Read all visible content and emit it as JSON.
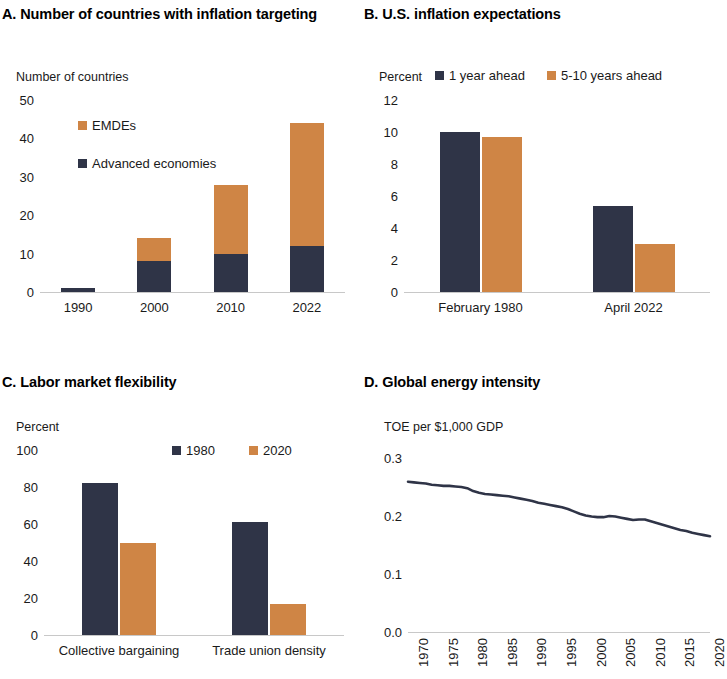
{
  "figure": {
    "panels": [
      "A",
      "B",
      "C",
      "D"
    ]
  },
  "colors": {
    "advanced": "#2f3447",
    "emdes": "#cf8545",
    "line": "#2f3447",
    "axis": "#c8c8c8",
    "text": "#1a1a1a"
  },
  "panel_a": {
    "title": "A. Number of countries with inflation targeting",
    "axis_unit": "Number of countries",
    "legend": [
      {
        "label": "EMDEs",
        "color": "#cf8545"
      },
      {
        "label": "Advanced economies",
        "color": "#2f3447"
      }
    ],
    "yticks": [
      "0",
      "10",
      "20",
      "30",
      "40",
      "50"
    ],
    "xticks": [
      "1990",
      "2000",
      "2010",
      "2022"
    ]
  },
  "panel_b": {
    "title": "B. U.S. inflation expectations",
    "axis_unit": "Percent",
    "legend": [
      {
        "label": "1 year ahead",
        "color": "#2f3447"
      },
      {
        "label": "5-10 years ahead",
        "color": "#cf8545"
      }
    ],
    "yticks": [
      "0",
      "2",
      "4",
      "6",
      "8",
      "10",
      "12"
    ],
    "xticks": [
      "February  1980",
      "April  2022"
    ]
  },
  "panel_c": {
    "title": "C. Labor market flexibility",
    "axis_unit": "Percent",
    "legend": [
      {
        "label": "1980",
        "color": "#2f3447"
      },
      {
        "label": "2020",
        "color": "#cf8545"
      }
    ],
    "yticks": [
      "0",
      "20",
      "40",
      "60",
      "80",
      "100"
    ],
    "xticks": [
      "Collective bargaining",
      "Trade union density"
    ]
  },
  "panel_d": {
    "title": "D. Global energy intensity",
    "axis_unit": "TOE per $1,000 GDP",
    "yticks": [
      "0.0",
      "0.1",
      "0.2",
      "0.3"
    ],
    "xticks": [
      "1970",
      "1975",
      "1980",
      "1985",
      "1990",
      "1995",
      "2000",
      "2005",
      "2010",
      "2015",
      "2020"
    ]
  },
  "chart_data": [
    {
      "panel": "A",
      "type": "bar",
      "stacked": true,
      "title": "A. Number of countries with inflation targeting",
      "xlabel": "",
      "ylabel": "Number of countries",
      "ylim": [
        0,
        50
      ],
      "yticks": [
        0,
        10,
        20,
        30,
        40,
        50
      ],
      "grid": false,
      "legend_position": "upper-left",
      "categories": [
        "1990",
        "2000",
        "2010",
        "2022"
      ],
      "series": [
        {
          "name": "Advanced economies",
          "color": "#2f3447",
          "values": [
            1,
            8,
            10,
            12
          ]
        },
        {
          "name": "EMDEs",
          "color": "#cf8545",
          "values": [
            0,
            6,
            18,
            32
          ]
        }
      ],
      "totals": [
        1,
        14,
        28,
        44
      ]
    },
    {
      "panel": "B",
      "type": "bar",
      "stacked": false,
      "title": "B. U.S. inflation expectations",
      "xlabel": "",
      "ylabel": "Percent",
      "ylim": [
        0,
        12
      ],
      "yticks": [
        0,
        2,
        4,
        6,
        8,
        10,
        12
      ],
      "grid": false,
      "legend_position": "upper-right",
      "categories": [
        "February  1980",
        "April  2022"
      ],
      "series": [
        {
          "name": "1 year ahead",
          "color": "#2f3447",
          "values": [
            10.0,
            5.4
          ]
        },
        {
          "name": "5-10 years ahead",
          "color": "#cf8545",
          "values": [
            9.7,
            3.0
          ]
        }
      ]
    },
    {
      "panel": "C",
      "type": "bar",
      "stacked": false,
      "title": "C. Labor market flexibility",
      "xlabel": "",
      "ylabel": "Percent",
      "ylim": [
        0,
        100
      ],
      "yticks": [
        0,
        20,
        40,
        60,
        80,
        100
      ],
      "grid": false,
      "legend_position": "upper-right",
      "categories": [
        "Collective bargaining",
        "Trade union density"
      ],
      "series": [
        {
          "name": "1980",
          "color": "#2f3447",
          "values": [
            82,
            61
          ]
        },
        {
          "name": "2020",
          "color": "#cf8545",
          "values": [
            50,
            17
          ]
        }
      ]
    },
    {
      "panel": "D",
      "type": "line",
      "title": "D. Global energy intensity",
      "xlabel": "",
      "ylabel": "TOE per $1,000 GDP",
      "ylim": [
        0.0,
        0.3
      ],
      "yticks": [
        0.0,
        0.1,
        0.2,
        0.3
      ],
      "xlim": [
        1970,
        2021
      ],
      "xticks": [
        1970,
        1975,
        1980,
        1985,
        1990,
        1995,
        2000,
        2005,
        2010,
        2015,
        2020
      ],
      "grid": false,
      "legend_position": "none",
      "series": [
        {
          "name": "Global energy intensity",
          "color": "#2f3447",
          "x": [
            1970,
            1971,
            1972,
            1973,
            1974,
            1975,
            1976,
            1977,
            1978,
            1979,
            1980,
            1981,
            1982,
            1983,
            1984,
            1985,
            1986,
            1987,
            1988,
            1989,
            1990,
            1991,
            1992,
            1993,
            1994,
            1995,
            1996,
            1997,
            1998,
            1999,
            2000,
            2001,
            2002,
            2003,
            2004,
            2005,
            2006,
            2007,
            2008,
            2009,
            2010,
            2011,
            2012,
            2013,
            2014,
            2015,
            2016,
            2017,
            2018,
            2019,
            2020,
            2021
          ],
          "values": [
            0.259,
            0.258,
            0.257,
            0.256,
            0.254,
            0.253,
            0.252,
            0.252,
            0.251,
            0.25,
            0.248,
            0.243,
            0.24,
            0.238,
            0.237,
            0.236,
            0.235,
            0.234,
            0.232,
            0.23,
            0.228,
            0.226,
            0.223,
            0.221,
            0.219,
            0.217,
            0.215,
            0.212,
            0.208,
            0.204,
            0.201,
            0.199,
            0.198,
            0.198,
            0.2,
            0.199,
            0.197,
            0.195,
            0.193,
            0.194,
            0.194,
            0.191,
            0.188,
            0.185,
            0.182,
            0.179,
            0.176,
            0.174,
            0.171,
            0.169,
            0.167,
            0.165
          ]
        }
      ]
    }
  ]
}
